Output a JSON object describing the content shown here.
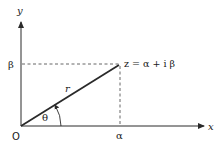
{
  "diagram": {
    "type": "complex-plane-polar-representation",
    "axes": {
      "x_label": "x",
      "y_label": "y",
      "origin_label": "O"
    },
    "point": {
      "label": "z = α + i β",
      "x_label": "α",
      "y_label": "β"
    },
    "vector": {
      "magnitude_label": "r",
      "angle_label": "θ"
    },
    "colors": {
      "line": "#2a2a2a",
      "dashed": "#555555",
      "text": "#1a1a1a",
      "background": "#ffffff"
    }
  }
}
